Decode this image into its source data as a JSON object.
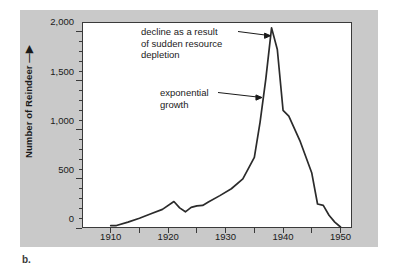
{
  "figure": {
    "panel_label": "b.",
    "background_color": "#c9c9c9",
    "plot_background_color": "#ffffff",
    "line_color": "#2b2b2b"
  },
  "chart_data": {
    "type": "line",
    "title": "",
    "xlabel": "",
    "ylabel": "Number of Reindeer",
    "xlim": [
      1905,
      1952
    ],
    "ylim": [
      0,
      2100
    ],
    "grid": false,
    "legend": null,
    "x_ticks": [
      1910,
      1920,
      1930,
      1940,
      1950
    ],
    "x_tick_labels": [
      "1910",
      "1920",
      "1930",
      "1940",
      "1950"
    ],
    "x_minor_tick_interval": 5,
    "y_ticks": [
      0,
      500,
      1000,
      1500,
      2000
    ],
    "y_tick_labels": [
      "0",
      "500",
      "1,000",
      "1,500",
      "2,000"
    ],
    "y_minor_tick_interval": 100,
    "series": [
      {
        "name": "Reindeer population",
        "x": [
          1910,
          1911,
          1913,
          1915,
          1917,
          1919,
          1921,
          1922,
          1923,
          1924,
          1925,
          1926,
          1927,
          1929,
          1931,
          1933,
          1935,
          1936,
          1937,
          1938,
          1939,
          1940,
          1941,
          1943,
          1945,
          1946,
          1947,
          1948,
          1949,
          1950
        ],
        "y": [
          25,
          25,
          60,
          100,
          145,
          190,
          270,
          205,
          165,
          210,
          225,
          230,
          265,
          330,
          400,
          500,
          720,
          1080,
          1520,
          2040,
          1820,
          1200,
          1140,
          880,
          560,
          245,
          230,
          130,
          60,
          10
        ]
      }
    ],
    "annotations": [
      {
        "id": "decline",
        "text": "decline as a result\nof sudden resource\ndepletion",
        "target_x": 1938,
        "target_y": 1960
      },
      {
        "id": "exponential",
        "text": "exponential\ngrowth",
        "target_x": 1936.5,
        "target_y": 1330
      }
    ]
  }
}
